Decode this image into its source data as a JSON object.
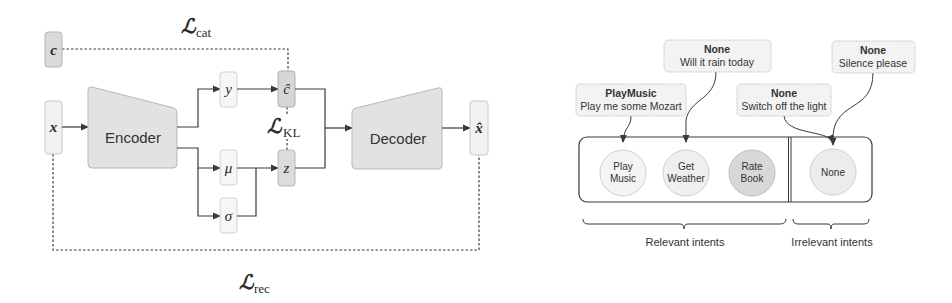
{
  "left_diagram": {
    "nodes": {
      "c": "c",
      "x": "x",
      "encoder": "Encoder",
      "y": "y",
      "mu": "μ",
      "sigma": "σ",
      "c_hat": "ĉ",
      "z": "z",
      "decoder": "Decoder",
      "x_hat": "x̂"
    },
    "losses": {
      "cat": {
        "symbol": "ℒ",
        "sub": "cat"
      },
      "kl": {
        "symbol": "ℒ",
        "sub": "KL"
      },
      "rec": {
        "symbol": "ℒ",
        "sub": "rec"
      }
    }
  },
  "right_diagram": {
    "utterances": [
      {
        "intent": "PlayMusic",
        "text": "Play me some Mozart"
      },
      {
        "intent": "None",
        "text": "Will it rain today"
      },
      {
        "intent": "None",
        "text": "Switch off the light"
      },
      {
        "intent": "None",
        "text": "Silence please"
      }
    ],
    "intents": [
      {
        "line1": "Play",
        "line2": "Music"
      },
      {
        "line1": "Get",
        "line2": "Weather"
      },
      {
        "line1": "Rate",
        "line2": "Book"
      },
      {
        "line1": "None",
        "line2": ""
      }
    ],
    "groups": {
      "relevant": "Relevant intents",
      "irrelevant": "Irrelevant intents"
    }
  },
  "colors": {
    "stroke": "#3a3a3a",
    "box_fill": "#f3f3f3",
    "box_border": "#c8c8c8",
    "shaded_fill": "#dcdcdc",
    "encoder_fill": "#e4e4e4"
  }
}
